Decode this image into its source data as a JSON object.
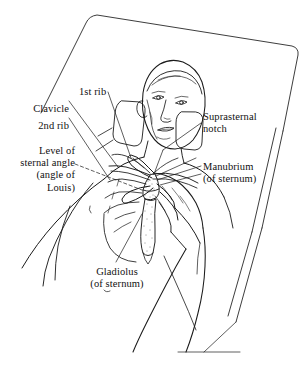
{
  "figure": {
    "kind": "anatomical-line-drawing",
    "background_color": "#ffffff",
    "ink_color": "#1a1a1a"
  },
  "labels": [
    {
      "id": "first-rib",
      "name": "label-1st-rib",
      "text": "1st rib",
      "align": "left",
      "x": 79,
      "y": 86
    },
    {
      "id": "clavicle",
      "name": "label-clavicle",
      "text": "Clavicle",
      "align": "right",
      "x": 22,
      "y": 103
    },
    {
      "id": "second-rib",
      "name": "label-2nd-rib",
      "text": "2nd rib",
      "align": "right",
      "x": 27,
      "y": 120
    },
    {
      "id": "sternal-angle",
      "name": "label-level-of-sternal-angle",
      "text": "Level of\nsternal angle\n(angle of\nLouis)",
      "align": "right",
      "x": 2,
      "y": 145
    },
    {
      "id": "suprasternal-notch",
      "name": "label-suprasternal-notch",
      "text": "Suprasternal\nnotch",
      "align": "left",
      "x": 203,
      "y": 111
    },
    {
      "id": "manubrium",
      "name": "label-manubrium",
      "text": "Manubrium\n(of sternum)",
      "align": "left",
      "x": 203,
      "y": 161
    },
    {
      "id": "gladiolus",
      "name": "label-gladiolus",
      "text": "Gladiolus\n(of sternum)",
      "align": "center",
      "x": 72,
      "y": 266
    }
  ]
}
